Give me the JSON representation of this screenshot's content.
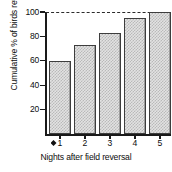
{
  "chart_data": {
    "type": "bar",
    "title": "",
    "subtitle": "",
    "xlabel": "Nights after field reversal",
    "ylabel": "Cumulative % of birds reversed",
    "categories": [
      "1",
      "2",
      "3",
      "4",
      "5"
    ],
    "values": [
      60,
      73,
      83,
      95,
      100
    ],
    "series": [
      {
        "name": "Cumulative % of birds reversed",
        "values": [
          60,
          73,
          83,
          95,
          100
        ]
      }
    ],
    "ylim": [
      0,
      100
    ],
    "yticks": [
      20,
      40,
      60,
      80,
      100
    ],
    "ytick_labels": [
      "20",
      "40",
      "60",
      "80",
      "100"
    ],
    "xtick_labels": [
      "1",
      "2",
      "3",
      "4",
      "5"
    ],
    "grid": false,
    "legend": false,
    "legend_position": "none",
    "annotations": [
      {
        "name": "reference-line-100",
        "type": "hline",
        "value": 100,
        "style": "dashed",
        "label": ""
      },
      {
        "name": "origin-marker",
        "type": "marker",
        "shape": "diamond",
        "label": ""
      }
    ],
    "bar_style": {
      "fill": "#e2e2e2",
      "pattern": "stipple-checker",
      "pattern_color": "#b9b9b9",
      "edge_color": "#3d3d3d"
    },
    "axis_color": "#1a1a1a",
    "text_color": "#0d0d0d"
  }
}
